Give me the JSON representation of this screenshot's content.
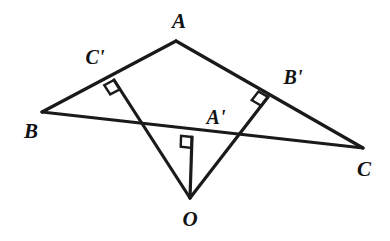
{
  "figure": {
    "kind": "geometry-diagram",
    "background_color": "#ffffff",
    "stroke_color": "#1a1a1a",
    "stroke_width": 3.2,
    "width": 390,
    "height": 241
  },
  "points": {
    "A": {
      "label": "A",
      "x": 176,
      "y": 41,
      "label_x": 179,
      "label_y": 21
    },
    "B": {
      "label": "B",
      "x": 42,
      "y": 112,
      "label_x": 31,
      "label_y": 131
    },
    "C": {
      "label": "C",
      "x": 363,
      "y": 148,
      "label_x": 364,
      "label_y": 169
    },
    "O": {
      "label": "O",
      "x": 190,
      "y": 198,
      "label_x": 190,
      "label_y": 219
    },
    "Ap": {
      "label": "A'",
      "x": 192,
      "y": 137,
      "label_x": 216,
      "label_y": 117
    },
    "Bp": {
      "label": "B'",
      "x": 268,
      "y": 97,
      "label_x": 293,
      "label_y": 77
    },
    "Cp": {
      "label": "C'",
      "x": 114,
      "y": 80,
      "label_x": 95,
      "label_y": 57
    }
  },
  "segments": [
    {
      "name": "side-AB",
      "from": "A",
      "to": "B"
    },
    {
      "name": "side-AC",
      "from": "A",
      "to": "C"
    },
    {
      "name": "side-BC",
      "from": "B",
      "to": "C"
    },
    {
      "name": "perp-O-Ap",
      "from": "O",
      "to": "Ap"
    },
    {
      "name": "perp-O-Bp",
      "from": "O",
      "to": "Bp"
    },
    {
      "name": "perp-O-Cp",
      "from": "O",
      "to": "Cp"
    }
  ],
  "right_angle_marks": [
    {
      "name": "right-angle-at-a-prime",
      "at": "Ap"
    },
    {
      "name": "right-angle-at-b-prime",
      "at": "Bp"
    },
    {
      "name": "right-angle-at-c-prime",
      "at": "Cp"
    }
  ]
}
